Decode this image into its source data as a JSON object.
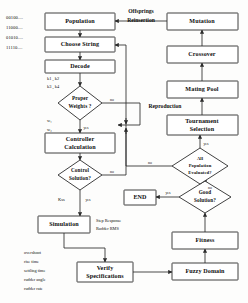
{
  "colors": {
    "stroke": "#2b2b2b",
    "text": "#0d0d0d",
    "box_fill": "#ffffff",
    "background": "#fdfdfc"
  },
  "nodes": {
    "population": {
      "label": "Population",
      "shape": "box",
      "x": 45,
      "y": 13,
      "w": 70,
      "h": 17
    },
    "choose_string": {
      "label": "Choose String",
      "shape": "box",
      "x": 45,
      "y": 37,
      "w": 70,
      "h": 15
    },
    "decode": {
      "label": "Decode",
      "shape": "box",
      "x": 45,
      "y": 60,
      "w": 70,
      "h": 13
    },
    "proper_weights": {
      "label1": "Proper",
      "label2": "Weights ?",
      "shape": "diamond",
      "cx": 80,
      "cy": 103,
      "rx": 22,
      "ry": 17
    },
    "controller_calc": {
      "label1": "Controller",
      "label2": "Calculation",
      "shape": "box",
      "x": 45,
      "y": 133,
      "w": 70,
      "h": 20
    },
    "control_solution": {
      "label1": "Control",
      "label2": "Solution?",
      "shape": "diamond",
      "cx": 80,
      "cy": 175,
      "rx": 22,
      "ry": 15
    },
    "simulation": {
      "label": "Simulation",
      "shape": "box",
      "x": 38,
      "y": 216,
      "w": 52,
      "h": 17
    },
    "verify_spec": {
      "label1": "Verify",
      "label2": "Specifications",
      "shape": "box",
      "x": 77,
      "y": 262,
      "w": 56,
      "h": 20
    },
    "fuzzy_domain": {
      "label": "Fuzzy  Domain",
      "shape": "box",
      "x": 172,
      "y": 263,
      "w": 66,
      "h": 17
    },
    "fitness": {
      "label": "Fitness",
      "shape": "box",
      "x": 172,
      "y": 232,
      "w": 66,
      "h": 17
    },
    "good_solution": {
      "label1": "Good",
      "label2": "Solution?",
      "shape": "diamond",
      "cx": 205,
      "cy": 197,
      "rx": 26,
      "ry": 16
    },
    "end": {
      "label": "END",
      "shape": "box",
      "x": 124,
      "y": 190,
      "w": 32,
      "h": 15
    },
    "all_pop_eval": {
      "label1": "All",
      "label2": "Population",
      "label3": "Evaluated?",
      "shape": "diamond",
      "cx": 200,
      "cy": 166,
      "rx": 28,
      "ry": 18
    },
    "tournament": {
      "label1": "Tournament",
      "label2": "Selection",
      "shape": "box",
      "x": 167,
      "y": 115,
      "w": 71,
      "h": 20
    },
    "mating_pool": {
      "label": "Mating  Pool",
      "shape": "box",
      "x": 167,
      "y": 81,
      "w": 71,
      "h": 17
    },
    "crossover": {
      "label": "Crossover",
      "shape": "box",
      "x": 167,
      "y": 46,
      "w": 71,
      "h": 17
    },
    "mutation": {
      "label": "Mutation",
      "shape": "box",
      "x": 167,
      "y": 13,
      "w": 71,
      "h": 17
    }
  },
  "edge_labels": {
    "offsprings": "Offsprings",
    "reinsertion": "Reinsertion",
    "reproduction": "Reproduction",
    "yes_weights": "yes",
    "no_weights": "no",
    "yes_control": "yes",
    "no_control": "no",
    "yes_goodsol": "yes",
    "no_goodsol": "no",
    "yes_allpop": "yes",
    "no_allpop": "no"
  },
  "annotations": {
    "binary_strings": [
      "00100....",
      "11000....",
      "01010....",
      "11110...."
    ],
    "decode_out_1": "k1 , k2",
    "decode_out_2": "k3 , k4",
    "weights_out_1": "w₁",
    "weights_out_2": "w₂",
    "control_gains": "Kss",
    "sim_out_1": "Step Response",
    "sim_out_2": "Rudder RMS",
    "spec_list": [
      "overshoot",
      "rise time",
      "settling time",
      "rudder angle",
      "rudder rate"
    ]
  }
}
